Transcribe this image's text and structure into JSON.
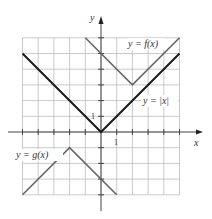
{
  "chart_data": {
    "type": "line",
    "title": "",
    "xlabel": "x",
    "ylabel": "y",
    "xlim": [
      -5,
      5
    ],
    "ylim": [
      -4,
      6
    ],
    "grid": true,
    "tick_labels": {
      "x": [
        "1"
      ],
      "y": [
        "1"
      ]
    },
    "series": [
      {
        "name": "y = |x|",
        "points": [
          [
            -5,
            5
          ],
          [
            0,
            0
          ],
          [
            5,
            5
          ]
        ],
        "color": "#1a1a1a"
      },
      {
        "name": "y = f(x)",
        "points": [
          [
            -1,
            6
          ],
          [
            2,
            3
          ],
          [
            5,
            6
          ]
        ],
        "color": "#666666"
      },
      {
        "name": "y = g(x)",
        "points": [
          [
            -5,
            -4
          ],
          [
            -2,
            -1
          ],
          [
            1,
            -4
          ]
        ],
        "color": "#666666"
      }
    ]
  },
  "labels": {
    "y_axis": "y",
    "x_axis": "x",
    "x_tick": "1",
    "y_tick": "1",
    "f": "y = f(x)",
    "abs": "y = |x|",
    "g": "y = g(x)"
  }
}
